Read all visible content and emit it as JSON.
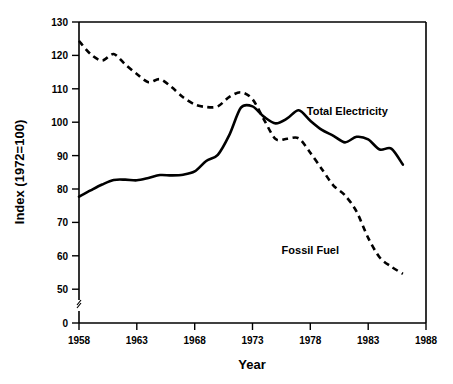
{
  "chart_data": {
    "type": "line",
    "title": "",
    "xlabel": "Year",
    "ylabel": "Index (1972=100)",
    "xlim": [
      1958,
      1988
    ],
    "ylim": [
      45,
      130
    ],
    "y_axis_break": true,
    "y_origin_label": "0",
    "grid": false,
    "legend_position": "inline-annotation",
    "xticks": [
      1958,
      1963,
      1968,
      1973,
      1978,
      1983,
      1988
    ],
    "xtick_labels": [
      "1958",
      "1963",
      "1968",
      "1973",
      "1978",
      "1983",
      "1988"
    ],
    "yticks": [
      0,
      50,
      60,
      70,
      80,
      90,
      100,
      110,
      120,
      130
    ],
    "ytick_labels": [
      "0",
      "50",
      "60",
      "70",
      "80",
      "90",
      "100",
      "110",
      "120",
      "130"
    ],
    "x": [
      1958,
      1959,
      1960,
      1961,
      1962,
      1963,
      1964,
      1965,
      1966,
      1967,
      1968,
      1969,
      1970,
      1971,
      1972,
      1973,
      1974,
      1975,
      1976,
      1977,
      1978,
      1979,
      1980,
      1981,
      1982,
      1983,
      1984,
      1985,
      1986
    ],
    "series": [
      {
        "name": "Total Electricity",
        "style": "solid",
        "color": "#000000",
        "label_x": 1981.2,
        "label_y": 101.5,
        "values": [
          76.6,
          78.5,
          80.3,
          81.7,
          81.8,
          81.6,
          82.3,
          83.2,
          83.1,
          83.3,
          84.3,
          87.5,
          89.4,
          95.5,
          103.8,
          104.2,
          101.0,
          99.0,
          100.5,
          103.0,
          99.8,
          97.0,
          95.2,
          93.2,
          94.9,
          94.1,
          91.0,
          91.3,
          86.4
        ]
      },
      {
        "name": "Fossil Fuel",
        "style": "dashed",
        "color": "#000000",
        "label_x": 1978.0,
        "label_y": 59.0,
        "values": [
          124.2,
          120.2,
          118.2,
          120.2,
          117.0,
          114.1,
          111.6,
          112.5,
          110.1,
          107.0,
          104.8,
          104.0,
          104.2,
          107.1,
          108.5,
          106.4,
          100.1,
          94.2,
          94.3,
          94.4,
          90.0,
          85.0,
          80.0,
          77.0,
          72.0,
          64.0,
          58.0,
          55.2,
          53.0
        ]
      }
    ],
    "annotations": [
      {
        "text": "Total Electricity"
      },
      {
        "text": "Fossil Fuel"
      }
    ]
  },
  "axis": {
    "x_title": "Year",
    "y_title": "Index (1972=100)"
  }
}
